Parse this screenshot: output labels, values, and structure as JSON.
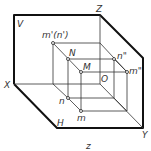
{
  "diagram": {
    "type": "three-view projection system (isometric)",
    "stroke_color": "#111111",
    "background": "#ffffff",
    "planes": {
      "V": "V",
      "H": "H"
    },
    "axes": {
      "X": "X",
      "Y": "Y",
      "Z": "Z",
      "O": "O"
    },
    "points": {
      "m_prime_n_prime": "m'(n')",
      "N": "N",
      "M": "M",
      "n_double_prime": "n\"",
      "m_double_prime": "m\"",
      "n": "n",
      "m": "m"
    },
    "caption": "z"
  }
}
